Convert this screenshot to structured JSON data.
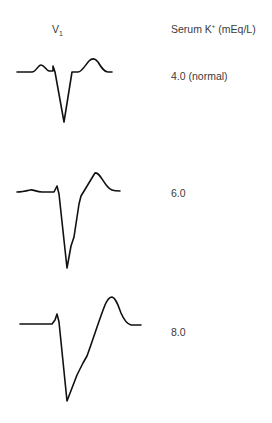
{
  "header": {
    "lead_label": "V",
    "lead_subscript": "1",
    "serum_label": "Serum K",
    "serum_superscript": "+",
    "serum_units": " (mEq/L)"
  },
  "traces": [
    {
      "label": "4.0 (normal)",
      "potassium": 4.0,
      "description": "Normal ECG complex: small P wave, deep narrow QS complex, upright T wave"
    },
    {
      "label": "6.0",
      "potassium": 6.0,
      "description": "Widened QRS complex with peaked T wave"
    },
    {
      "label": "8.0",
      "potassium": 8.0,
      "description": "Markedly widened QRS merging into tall T wave, P wave absent"
    }
  ],
  "colors": {
    "line": "#111111",
    "text": "#3a3a3a",
    "background": "#ffffff"
  }
}
